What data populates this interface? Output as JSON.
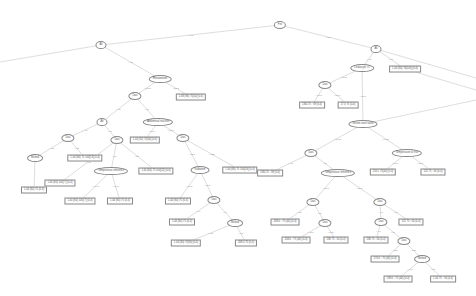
{
  "diagram": {
    "type": "decision-tree",
    "nodes": [
      {
        "id": "n0",
        "shape": "ellipse",
        "x": 280,
        "y": 25,
        "label": "Fev"
      },
      {
        "id": "n1",
        "shape": "ellipse",
        "x": 101,
        "y": 45,
        "label": "Alt"
      },
      {
        "id": "n2",
        "shape": "ellipse",
        "x": 376,
        "y": 49,
        "label": "Alt"
      },
      {
        "id": "n3",
        "shape": "ellipse",
        "x": 160,
        "y": 79,
        "label": "Rheumatism"
      },
      {
        "id": "n4",
        "shape": "box",
        "x": 191,
        "y": 97,
        "label": "1.68 (86) 75[54] (0.4)"
      },
      {
        "id": "n5",
        "shape": "ellipse",
        "x": 135,
        "y": 96,
        "label": "Dias"
      },
      {
        "id": "n6",
        "shape": "ellipse",
        "x": 362,
        "y": 68,
        "label": "Leukocyte >1"
      },
      {
        "id": "n7",
        "shape": "box",
        "x": 405,
        "y": 69,
        "label": "1.44 (84) 76[140] (0.4)"
      },
      {
        "id": "n8",
        "shape": "ellipse",
        "x": 325,
        "y": 85,
        "label": "Dias"
      },
      {
        "id": "n9",
        "shape": "box",
        "x": 312,
        "y": 105,
        "label": "136L75 : 39 (0.4)"
      },
      {
        "id": "n10",
        "shape": "box",
        "x": 348,
        "y": 105,
        "label": "17.0 75 (0.4)"
      },
      {
        "id": "n11",
        "shape": "ellipse",
        "x": 102,
        "y": 122,
        "label": "Alt"
      },
      {
        "id": "n12",
        "shape": "ellipse",
        "x": 158,
        "y": 122,
        "label": "Abdominal reaction"
      },
      {
        "id": "n13",
        "shape": "box",
        "x": 145,
        "y": 140,
        "label": "1.44 (92) 75[56] (0.4)"
      },
      {
        "id": "n14",
        "shape": "ellipse",
        "x": 68,
        "y": 138,
        "label": "Dias"
      },
      {
        "id": "n15",
        "shape": "ellipse",
        "x": 117,
        "y": 140,
        "label": "Dias"
      },
      {
        "id": "n16",
        "shape": "ellipse",
        "x": 183,
        "y": 138,
        "label": "Dias"
      },
      {
        "id": "n17",
        "shape": "ellipse",
        "x": 363,
        "y": 124,
        "label": "Serum stool ration"
      },
      {
        "id": "n18",
        "shape": "ellipse",
        "x": 311,
        "y": 153,
        "label": "Dias"
      },
      {
        "id": "n19",
        "shape": "ellipse",
        "x": 407,
        "y": 153,
        "label": "Temperature at rise"
      },
      {
        "id": "n20",
        "shape": "ellipse",
        "x": 35,
        "y": 158,
        "label": "Melted"
      },
      {
        "id": "n21",
        "shape": "box",
        "x": 85,
        "y": 158,
        "label": "1.44 (84) 75 100[13] (0.4)"
      },
      {
        "id": "n22",
        "shape": "ellipse",
        "x": 111,
        "y": 171,
        "label": "Temperature reference"
      },
      {
        "id": "n23",
        "shape": "box",
        "x": 156,
        "y": 171,
        "label": "1.44 (84) 75 100[11] (0.4)"
      },
      {
        "id": "n24",
        "shape": "ellipse",
        "x": 200,
        "y": 170,
        "label": "Kalbkrem"
      },
      {
        "id": "n25",
        "shape": "box",
        "x": 240,
        "y": 170,
        "label": "1.44 (84) 75 100[16] (0.4)"
      },
      {
        "id": "n26",
        "shape": "box",
        "x": 270,
        "y": 173,
        "label": "136L75 : 39 (0.4)"
      },
      {
        "id": "n27",
        "shape": "ellipse",
        "x": 338,
        "y": 173,
        "label": "Temperature reference"
      },
      {
        "id": "n28",
        "shape": "box",
        "x": 383,
        "y": 172,
        "label": "150 L 75[40] (0.4)"
      },
      {
        "id": "n29",
        "shape": "box",
        "x": 433,
        "y": 172,
        "label": "125 75 : 56 (0.4)"
      },
      {
        "id": "n30",
        "shape": "box",
        "x": 60,
        "y": 183,
        "label": "1.44 (84) 100[ 7] (0.4)"
      },
      {
        "id": "n31",
        "shape": "box",
        "x": 34,
        "y": 190,
        "label": "1.44 (84) 75 (0.4)"
      },
      {
        "id": "n32",
        "shape": "box",
        "x": 80,
        "y": 201,
        "label": "1.44 (84) 100[ 7] (0.4)"
      },
      {
        "id": "n33",
        "shape": "box",
        "x": 120,
        "y": 201,
        "label": "1.44 (84) 75 (0.4)"
      },
      {
        "id": "n34",
        "shape": "box",
        "x": 178,
        "y": 201,
        "label": "1.44 (84) 75 (0.4)"
      },
      {
        "id": "n35",
        "shape": "ellipse",
        "x": 214,
        "y": 200,
        "label": "Dias"
      },
      {
        "id": "n36",
        "shape": "ellipse",
        "x": 313,
        "y": 202,
        "label": "Dias"
      },
      {
        "id": "n37",
        "shape": "ellipse",
        "x": 380,
        "y": 202,
        "label": "Dias"
      },
      {
        "id": "n38",
        "shape": "box",
        "x": 182,
        "y": 222,
        "label": "1.44 (84) 75 (0.4)"
      },
      {
        "id": "n39",
        "shape": "ellipse",
        "x": 235,
        "y": 223,
        "label": "Melted"
      },
      {
        "id": "n40",
        "shape": "box",
        "x": 285,
        "y": 222,
        "label": "208.0 : 75 (40) (0.4)"
      },
      {
        "id": "n41",
        "shape": "ellipse",
        "x": 325,
        "y": 223,
        "label": "Dias"
      },
      {
        "id": "n42",
        "shape": "ellipse",
        "x": 381,
        "y": 222,
        "label": "Dias"
      },
      {
        "id": "n43",
        "shape": "box",
        "x": 411,
        "y": 222,
        "label": "125 75 : 56 (0.4)"
      },
      {
        "id": "n44",
        "shape": "box",
        "x": 186,
        "y": 243,
        "label": "1.44 (84) 75[90] (0.4)"
      },
      {
        "id": "n45",
        "shape": "box",
        "x": 246,
        "y": 243,
        "label": "208.0 75 (0.4)"
      },
      {
        "id": "n46",
        "shape": "box",
        "x": 296,
        "y": 240,
        "label": "208.0 : 75 (40) (0.4)"
      },
      {
        "id": "n47",
        "shape": "box",
        "x": 336,
        "y": 240,
        "label": "236 75 : 50 (0.4)"
      },
      {
        "id": "n48",
        "shape": "box",
        "x": 376,
        "y": 240,
        "label": "236 75 : 56 (0.4)"
      },
      {
        "id": "n49",
        "shape": "ellipse",
        "x": 404,
        "y": 241,
        "label": "Dias"
      },
      {
        "id": "n50",
        "shape": "box",
        "x": 385,
        "y": 259,
        "label": "170.0 : 75 (40) (0.4)"
      },
      {
        "id": "n51",
        "shape": "ellipse",
        "x": 422,
        "y": 259,
        "label": "Melted"
      },
      {
        "id": "n52",
        "shape": "box",
        "x": 398,
        "y": 279,
        "label": "138.0 : 75 (40) (0.4)"
      },
      {
        "id": "n53",
        "shape": "box",
        "x": 443,
        "y": 279,
        "label": "1.44 75 : 56 (0.4)"
      }
    ],
    "edges": [
      {
        "from": "n0",
        "to": "n1",
        "label": "< 0.5"
      },
      {
        "from": "n0",
        "to": "n2",
        "label": "> 0.5"
      },
      {
        "from": "n1",
        "to": "n3",
        "label": "< 17"
      },
      {
        "from": "n1",
        "to": "n18x",
        "label": ""
      },
      {
        "from": "n3",
        "to": "n5",
        "label": "< 50.5"
      },
      {
        "from": "n3",
        "to": "n4",
        "label": "> 50.5"
      },
      {
        "from": "n2",
        "to": "n6",
        "label": "< 61"
      },
      {
        "from": "n2",
        "to": "n7",
        "label": "> 61"
      },
      {
        "from": "n6",
        "to": "n8",
        "label": "< 10.5"
      },
      {
        "from": "n6",
        "to": "n17",
        "label": "> 10.5"
      },
      {
        "from": "n8",
        "to": "n9",
        "label": "< 78.5"
      },
      {
        "from": "n8",
        "to": "n10",
        "label": "> 78.5"
      },
      {
        "from": "n5",
        "to": "n11",
        "label": "< 86"
      },
      {
        "from": "n5",
        "to": "n12",
        "label": "> 86"
      },
      {
        "from": "n12",
        "to": "n13",
        "label": "< 68.1"
      },
      {
        "from": "n12",
        "to": "n16",
        "label": "> 68.1"
      },
      {
        "from": "n11",
        "to": "n14",
        "label": "< 40"
      },
      {
        "from": "n11",
        "to": "n15",
        "label": "> 40"
      },
      {
        "from": "n14",
        "to": "n20",
        "label": "< 85"
      },
      {
        "from": "n14",
        "to": "n21",
        "label": "> 85"
      },
      {
        "from": "n20",
        "to": "n31",
        "label": ""
      },
      {
        "from": "n15",
        "to": "n22",
        "label": "< 57"
      },
      {
        "from": "n15",
        "to": "n30",
        "label": "< 18"
      },
      {
        "from": "n22",
        "to": "n32",
        "label": "< 69.5"
      },
      {
        "from": "n22",
        "to": "n33",
        "label": "> 69.5"
      },
      {
        "from": "n15",
        "to": "n23",
        "label": "> 57"
      },
      {
        "from": "n16",
        "to": "n24",
        "label": "< 152"
      },
      {
        "from": "n16",
        "to": "n25",
        "label": "> 152"
      },
      {
        "from": "n24",
        "to": "n34",
        "label": "< 68.5"
      },
      {
        "from": "n24",
        "to": "n35",
        "label": "> 68.5"
      },
      {
        "from": "n35",
        "to": "n38",
        "label": "< 64"
      },
      {
        "from": "n35",
        "to": "n39",
        "label": "> 64"
      },
      {
        "from": "n39",
        "to": "n44",
        "label": "< 0.5"
      },
      {
        "from": "n39",
        "to": "n45",
        "label": "> 0.5"
      },
      {
        "from": "n17",
        "to": "n18",
        "label": "< 46.26"
      },
      {
        "from": "n17",
        "to": "n19",
        "label": "> 46.26"
      },
      {
        "from": "n18",
        "to": "n26",
        "label": "< 90"
      },
      {
        "from": "n18",
        "to": "n27",
        "label": "> 90"
      },
      {
        "from": "n19",
        "to": "n28",
        "label": "< 37.6"
      },
      {
        "from": "n19",
        "to": "n29",
        "label": "> 37.6"
      },
      {
        "from": "n27",
        "to": "n36",
        "label": "< 36.8"
      },
      {
        "from": "n27",
        "to": "n37",
        "label": "> 36.8"
      },
      {
        "from": "n36",
        "to": "n40",
        "label": "< 65"
      },
      {
        "from": "n36",
        "to": "n41",
        "label": "> 65"
      },
      {
        "from": "n41",
        "to": "n46",
        "label": "< 108"
      },
      {
        "from": "n41",
        "to": "n47",
        "label": "> 108"
      },
      {
        "from": "n37",
        "to": "n42",
        "label": "< 97"
      },
      {
        "from": "n37",
        "to": "n43",
        "label": "> 97"
      },
      {
        "from": "n42",
        "to": "n48",
        "label": "< 74"
      },
      {
        "from": "n42",
        "to": "n49",
        "label": "> 74"
      },
      {
        "from": "n49",
        "to": "n50",
        "label": "< 113"
      },
      {
        "from": "n49",
        "to": "n51",
        "label": "> 113"
      },
      {
        "from": "n51",
        "to": "n52",
        "label": "< 0.5"
      },
      {
        "from": "n51",
        "to": "n53",
        "label": "> 0.5"
      }
    ],
    "offscreen_edges": [
      {
        "from": "n1",
        "to_x": 0,
        "to_y": 62,
        "label": ""
      },
      {
        "from": "n2",
        "to_x": 476,
        "to_y": 78,
        "label": ""
      },
      {
        "from": "n7",
        "to_x": 476,
        "to_y": 90,
        "label": ""
      },
      {
        "from": "n17",
        "to_x": 476,
        "to_y": 100,
        "label": ""
      }
    ],
    "colors": {
      "edge": "#bbbbbb",
      "border": "#888888",
      "text": "#555555",
      "background": "#ffffff"
    }
  }
}
